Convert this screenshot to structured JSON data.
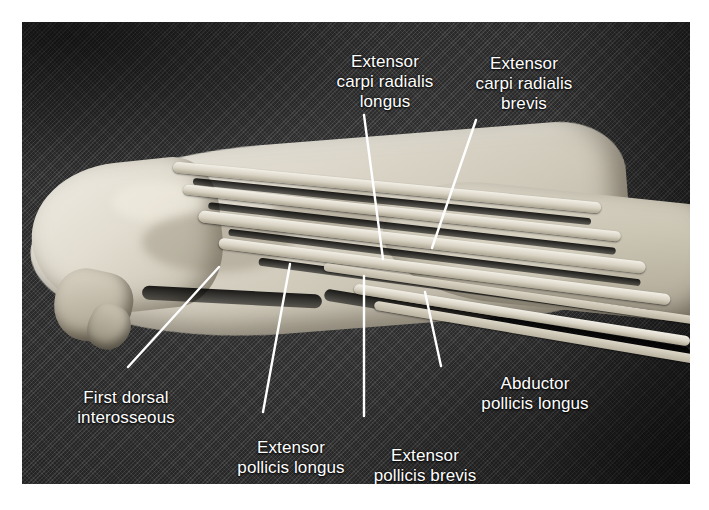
{
  "figure": {
    "kind": "anatomical-photograph",
    "background_color": "#343434",
    "specimen_color": "#ded9cc",
    "label_color": "#ffffff",
    "leader_color": "#ffffff"
  },
  "labels": [
    {
      "id": "ecrl",
      "text": "Extensor\ncarpi radialis\nlongus",
      "name": "Extensor carpi radialis longus"
    },
    {
      "id": "ecrb",
      "text": "Extensor\ncarpi radialis\nbrevis",
      "name": "Extensor carpi radialis brevis"
    },
    {
      "id": "fdi",
      "text": "First dorsal\ninterosseous",
      "name": "First dorsal interosseous"
    },
    {
      "id": "epl",
      "text": "Extensor\npollicis longus",
      "name": "Extensor pollicis longus"
    },
    {
      "id": "epb",
      "text": "Extensor\npollicis brevis",
      "name": "Extensor pollicis brevis"
    },
    {
      "id": "apl",
      "text": "Abductor\npollicis longus",
      "name": "Abductor pollicis longus"
    }
  ],
  "leaders": [
    {
      "id": "ecrl",
      "x1": 364,
      "y1": 115,
      "x2": 383,
      "y2": 259
    },
    {
      "id": "ecrb",
      "x1": 476,
      "y1": 120,
      "x2": 432,
      "y2": 248
    },
    {
      "id": "fdi",
      "x1": 219,
      "y1": 267,
      "x2": 128,
      "y2": 367
    },
    {
      "id": "epl",
      "x1": 290,
      "y1": 264,
      "x2": 263,
      "y2": 412
    },
    {
      "id": "epb",
      "x1": 364,
      "y1": 276,
      "x2": 364,
      "y2": 416
    },
    {
      "id": "apl",
      "x1": 425,
      "y1": 292,
      "x2": 441,
      "y2": 366
    }
  ],
  "bleed_text": "",
  "plate": {
    "left": 22,
    "top": 22,
    "width": 668,
    "height": 462
  }
}
